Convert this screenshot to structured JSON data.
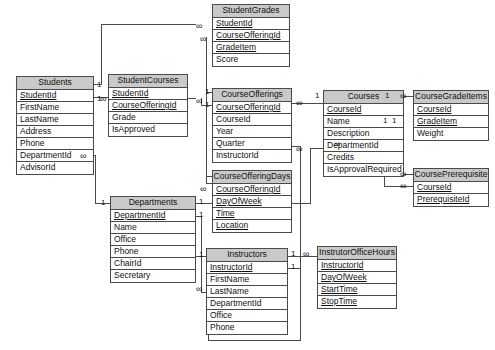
{
  "diagram": {
    "type": "entity-relationship-diagram",
    "background_color": "#ffffff",
    "entity_header_color": "#c9c9c9",
    "entity_body_color": "#ffffff",
    "line_color": "#4a4a4a",
    "cardinality_one": "1",
    "cardinality_many": "∞"
  },
  "entities": [
    {
      "id": "students",
      "name": "Students",
      "x": 16,
      "y": 76,
      "w": 78,
      "fields": [
        {
          "name": "StudentId",
          "key": true
        },
        {
          "name": "FirstName",
          "key": false
        },
        {
          "name": "LastName",
          "key": false
        },
        {
          "name": "Address",
          "key": false
        },
        {
          "name": "Phone",
          "key": false
        },
        {
          "name": "DepartmentId",
          "key": false
        },
        {
          "name": "AdvisorId",
          "key": false
        }
      ]
    },
    {
      "id": "student_courses",
      "name": "StudentCourses",
      "x": 108,
      "y": 74,
      "w": 80,
      "fields": [
        {
          "name": "StudentId",
          "key": true
        },
        {
          "name": "CourseOfferingId",
          "key": true
        },
        {
          "name": "Grade",
          "key": false
        },
        {
          "name": "IsApproved",
          "key": false
        }
      ]
    },
    {
      "id": "student_grades",
      "name": "StudentGrades",
      "x": 212,
      "y": 4,
      "w": 78,
      "fields": [
        {
          "name": "StudentId",
          "key": true
        },
        {
          "name": "CourseOfferingId",
          "key": true
        },
        {
          "name": "GradeItem",
          "key": true
        },
        {
          "name": "Score",
          "key": false
        }
      ]
    },
    {
      "id": "course_offerings",
      "name": "CourseOfferings",
      "x": 212,
      "y": 88,
      "w": 80,
      "fields": [
        {
          "name": "CourseOfferingId",
          "key": true
        },
        {
          "name": "CourseId",
          "key": false
        },
        {
          "name": "Year",
          "key": false
        },
        {
          "name": "Quarter",
          "key": false
        },
        {
          "name": "InstructorId",
          "key": false
        }
      ]
    },
    {
      "id": "course_offering_days",
      "name": "CourseOfferingDays",
      "x": 212,
      "y": 170,
      "w": 80,
      "fields": [
        {
          "name": "CourseOfferingId",
          "key": true
        },
        {
          "name": "DayOfWeek",
          "key": true
        },
        {
          "name": "Time",
          "key": true
        },
        {
          "name": "Location",
          "key": true
        }
      ]
    },
    {
      "id": "courses",
      "name": "Courses",
      "x": 323,
      "y": 90,
      "w": 81,
      "fields": [
        {
          "name": "CourseId",
          "key": true
        },
        {
          "name": "Name",
          "key": false
        },
        {
          "name": "Description",
          "key": false
        },
        {
          "name": "DepartmentId",
          "key": false
        },
        {
          "name": "Credits",
          "key": false
        },
        {
          "name": "IsApprovalRequired",
          "key": false
        }
      ]
    },
    {
      "id": "course_grade_items",
      "name": "CourseGradeItems",
      "x": 413,
      "y": 90,
      "w": 76,
      "fields": [
        {
          "name": "CourseId",
          "key": true
        },
        {
          "name": "GradeItem",
          "key": true
        },
        {
          "name": "Weight",
          "key": false
        }
      ]
    },
    {
      "id": "course_prerequisite",
      "name": "CoursePrerequisite",
      "x": 413,
      "y": 168,
      "w": 76,
      "fields": [
        {
          "name": "CourseId",
          "key": true
        },
        {
          "name": "PrerequisiteId",
          "key": true
        }
      ]
    },
    {
      "id": "departments",
      "name": "Departments",
      "x": 110,
      "y": 196,
      "w": 86,
      "fields": [
        {
          "name": "DepartmentId",
          "key": true
        },
        {
          "name": "Name",
          "key": false
        },
        {
          "name": "Office",
          "key": false
        },
        {
          "name": "Phone",
          "key": false
        },
        {
          "name": "ChairId",
          "key": false
        },
        {
          "name": "Secretary",
          "key": false
        }
      ]
    },
    {
      "id": "instructors",
      "name": "Instructors",
      "x": 206,
      "y": 248,
      "w": 82,
      "fields": [
        {
          "name": "InstructorId",
          "key": true
        },
        {
          "name": "FirstName",
          "key": false
        },
        {
          "name": "LastName",
          "key": false
        },
        {
          "name": "DepartmentId",
          "key": false
        },
        {
          "name": "Office",
          "key": false
        },
        {
          "name": "Phone",
          "key": false
        }
      ]
    },
    {
      "id": "instructor_office_hours",
      "name": "InstrutorOfficeHours",
      "x": 317,
      "y": 246,
      "w": 80,
      "fields": [
        {
          "name": "InstructorId",
          "key": true
        },
        {
          "name": "DayOfWeek",
          "key": true
        },
        {
          "name": "StartTime",
          "key": true
        },
        {
          "name": "StopTime",
          "key": true
        }
      ]
    }
  ],
  "cardinality_markers": [
    {
      "id": "m1",
      "label": "1",
      "x": 97,
      "y": 81
    },
    {
      "id": "m2",
      "label": "1",
      "x": 97,
      "y": 95
    },
    {
      "id": "m3",
      "label": "∞",
      "x": 196,
      "y": 22
    },
    {
      "id": "m4",
      "label": "∞",
      "x": 200,
      "y": 35
    },
    {
      "id": "m5",
      "label": "∞",
      "x": 100,
      "y": 95
    },
    {
      "id": "m6",
      "label": "∞",
      "x": 196,
      "y": 97
    },
    {
      "id": "m7",
      "label": "1",
      "x": 205,
      "y": 88
    },
    {
      "id": "m8",
      "label": "1",
      "x": 205,
      "y": 101
    },
    {
      "id": "m9",
      "label": "∞",
      "x": 80,
      "y": 152
    },
    {
      "id": "m10",
      "label": "1",
      "x": 101,
      "y": 199
    },
    {
      "id": "m11",
      "label": "∞",
      "x": 296,
      "y": 99
    },
    {
      "id": "m12",
      "label": "1",
      "x": 315,
      "y": 92
    },
    {
      "id": "m13",
      "label": "∞",
      "x": 296,
      "y": 145
    },
    {
      "id": "m14",
      "label": "1",
      "x": 385,
      "y": 92
    },
    {
      "id": "m15",
      "label": "∞",
      "x": 400,
      "y": 92
    },
    {
      "id": "m16",
      "label": "1",
      "x": 383,
      "y": 117
    },
    {
      "id": "m17",
      "label": "1",
      "x": 392,
      "y": 117
    },
    {
      "id": "m18",
      "label": "∞",
      "x": 400,
      "y": 170
    },
    {
      "id": "m19",
      "label": "∞",
      "x": 400,
      "y": 182
    },
    {
      "id": "m20",
      "label": "∞",
      "x": 200,
      "y": 185
    },
    {
      "id": "m21",
      "label": "1",
      "x": 199,
      "y": 198
    },
    {
      "id": "m22",
      "label": "1",
      "x": 199,
      "y": 211
    },
    {
      "id": "m23",
      "label": "1",
      "x": 199,
      "y": 251
    },
    {
      "id": "m24",
      "label": "∞",
      "x": 196,
      "y": 285
    },
    {
      "id": "m25",
      "label": "1",
      "x": 291,
      "y": 250
    },
    {
      "id": "m26",
      "label": "∞",
      "x": 303,
      "y": 250
    },
    {
      "id": "m27",
      "label": "1",
      "x": 291,
      "y": 263
    },
    {
      "id": "m28",
      "label": "∞",
      "x": 334,
      "y": 140
    }
  ],
  "relationships": [
    {
      "from": "students.StudentId",
      "to": "student_grades.StudentId",
      "from_card": "1",
      "to_card": "∞"
    },
    {
      "from": "students.StudentId",
      "to": "student_courses.StudentId",
      "from_card": "1",
      "to_card": "∞"
    },
    {
      "from": "students.DepartmentId",
      "to": "departments.DepartmentId",
      "from_card": "∞",
      "to_card": "1"
    },
    {
      "from": "student_courses.CourseOfferingId",
      "to": "student_grades.CourseOfferingId",
      "from_card": "∞",
      "to_card": "∞"
    },
    {
      "from": "course_offerings.CourseOfferingId",
      "to": "student_courses.CourseOfferingId",
      "from_card": "1",
      "to_card": "∞"
    },
    {
      "from": "course_offerings.CourseOfferingId",
      "to": "course_offering_days.CourseOfferingId",
      "from_card": "1",
      "to_card": "∞"
    },
    {
      "from": "courses.CourseId",
      "to": "course_offerings.CourseId",
      "from_card": "1",
      "to_card": "∞"
    },
    {
      "from": "courses.CourseId",
      "to": "course_grade_items.CourseId",
      "from_card": "1",
      "to_card": "∞"
    },
    {
      "from": "courses.CourseId",
      "to": "course_prerequisite.CourseId",
      "from_card": "1",
      "to_card": "∞"
    },
    {
      "from": "courses.CourseId",
      "to": "course_prerequisite.PrerequisiteId",
      "from_card": "1",
      "to_card": "∞"
    },
    {
      "from": "departments.DepartmentId",
      "to": "courses.DepartmentId",
      "from_card": "1",
      "to_card": "∞"
    },
    {
      "from": "departments.DepartmentId",
      "to": "instructors.DepartmentId",
      "from_card": "1",
      "to_card": "∞"
    },
    {
      "from": "departments.ChairId",
      "to": "instructors.InstructorId",
      "from_card": "1",
      "to_card": "∞"
    },
    {
      "from": "instructors.InstructorId",
      "to": "course_offerings.InstructorId",
      "from_card": "1",
      "to_card": "∞"
    },
    {
      "from": "instructors.InstructorId",
      "to": "instructor_office_hours.InstructorId",
      "from_card": "1",
      "to_card": "∞"
    }
  ]
}
